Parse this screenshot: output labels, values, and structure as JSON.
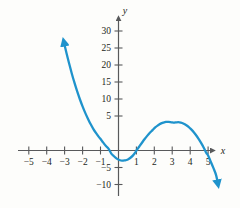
{
  "figure": {
    "background_color": "#fdfdfb",
    "axis_color": "#58595b",
    "curve_color": "#1f93cc",
    "label_color": "#231f20"
  },
  "axes": {
    "x_axis_name": "x",
    "y_axis_name": "y",
    "x_ticks": [
      {
        "value": -5,
        "label": "−5"
      },
      {
        "value": -4,
        "label": "−4"
      },
      {
        "value": -3,
        "label": "−3"
      },
      {
        "value": -2,
        "label": "−2"
      },
      {
        "value": -1,
        "label": "−1"
      },
      {
        "value": 1,
        "label": "1"
      },
      {
        "value": 2,
        "label": "2"
      },
      {
        "value": 3,
        "label": "3"
      },
      {
        "value": 4,
        "label": "4"
      },
      {
        "value": 5,
        "label": "5"
      }
    ],
    "y_ticks": [
      {
        "value": 30,
        "label": "30"
      },
      {
        "value": 25,
        "label": "25"
      },
      {
        "value": 20,
        "label": "20"
      },
      {
        "value": 15,
        "label": "15"
      },
      {
        "value": 10,
        "label": "10"
      },
      {
        "value": 5,
        "label": "5"
      },
      {
        "value": -5,
        "label": "−5"
      },
      {
        "value": -10,
        "label": "−10"
      }
    ]
  },
  "chart_data": {
    "type": "line",
    "title": "",
    "xlabel": "x",
    "ylabel": "y",
    "xlim": [
      -5.8,
      6.0
    ],
    "ylim": [
      -11.5,
      33.0
    ],
    "grid": false,
    "legend": null,
    "series": [
      {
        "name": "cubic curve",
        "color": "#1f93cc",
        "expression": "y = -0.6(x - 1)(x + 1)(x - 5)",
        "roots": [
          -1,
          1,
          5
        ],
        "local_minimum": {
          "x": 0.2,
          "y": -3.0
        },
        "local_maximum": {
          "x": 3.4,
          "y": 8.3
        },
        "arrow_start": {
          "x": -3.05,
          "y": 32.0
        },
        "arrow_end": {
          "x": 5.55,
          "y": -10.2
        },
        "x": [
          -3.05,
          -2.9,
          -2.75,
          -2.6,
          -2.45,
          -2.3,
          -2.15,
          -2.0,
          -1.85,
          -1.7,
          -1.55,
          -1.4,
          -1.25,
          -1.1,
          -1.0,
          -0.85,
          -0.7,
          -0.55,
          -0.4,
          -0.25,
          -0.1,
          0.05,
          0.2,
          0.35,
          0.5,
          0.65,
          0.8,
          0.95,
          1.0,
          1.15,
          1.3,
          1.45,
          1.6,
          1.75,
          1.9,
          2.05,
          2.2,
          2.35,
          2.5,
          2.65,
          2.8,
          2.95,
          3.1,
          3.25,
          3.4,
          3.55,
          3.7,
          3.85,
          4.0,
          4.15,
          4.3,
          4.45,
          4.6,
          4.75,
          4.9,
          5.0,
          5.15,
          5.3,
          5.45,
          5.55
        ],
        "y": [
          32.0,
          28.6,
          25.5,
          22.5,
          19.8,
          17.3,
          15.0,
          12.9,
          11.0,
          9.3,
          7.7,
          6.3,
          5.1,
          4.0,
          3.4,
          2.3,
          1.3,
          0.5,
          -0.9,
          -1.7,
          -2.4,
          -2.8,
          -3.0,
          -2.9,
          -2.7,
          -2.2,
          -1.5,
          -0.5,
          0.0,
          1.1,
          2.2,
          3.3,
          4.3,
          5.2,
          6.0,
          6.8,
          7.4,
          7.9,
          8.2,
          8.4,
          8.4,
          8.3,
          8.2,
          8.3,
          8.3,
          8.1,
          7.7,
          7.2,
          6.5,
          5.7,
          4.7,
          3.6,
          2.3,
          0.9,
          -0.7,
          -1.5,
          -3.3,
          -5.2,
          -7.3,
          -9.9
        ]
      }
    ]
  }
}
